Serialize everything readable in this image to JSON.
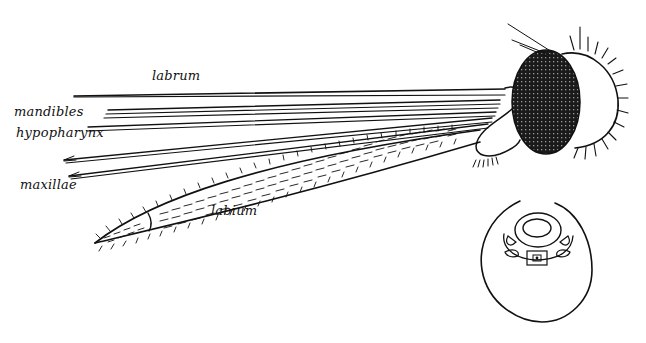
{
  "diagram": {
    "labels": {
      "labrum": "labrum",
      "mandibles": "mandibles",
      "hypopharynx": "hypopharynx",
      "maxillae": "maxillae",
      "labium": "labium"
    },
    "colors": {
      "ink": "#111111",
      "background": "#ffffff"
    }
  }
}
